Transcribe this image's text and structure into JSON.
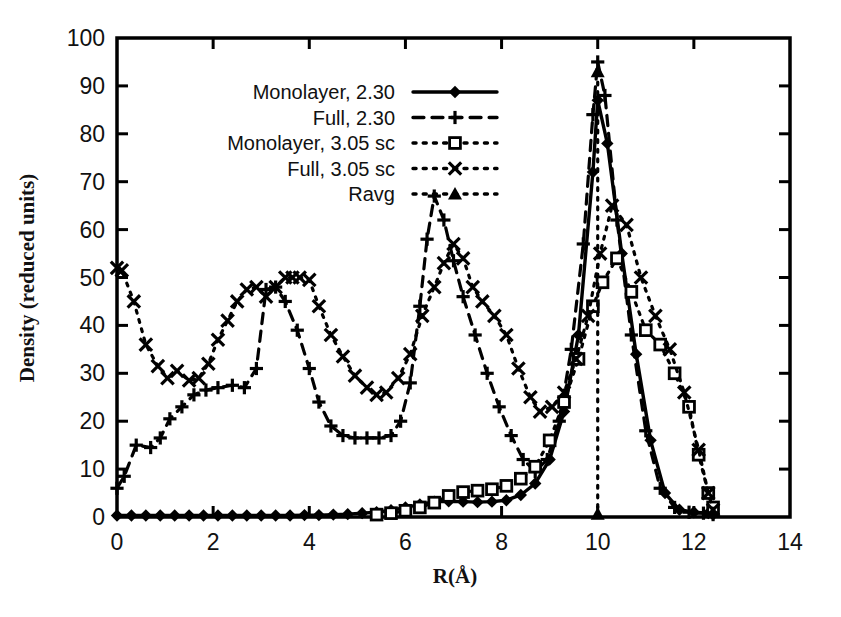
{
  "chart_data": {
    "type": "line",
    "title": "",
    "xlabel": "R(Å)",
    "ylabel": "Density (reduced units)",
    "xlim": [
      0,
      14
    ],
    "ylim": [
      0,
      100
    ],
    "xticks": [
      0,
      2,
      4,
      6,
      8,
      10,
      12,
      14
    ],
    "xtick_labels": [
      "0",
      "2",
      "4",
      "6",
      "8",
      "10",
      "12",
      "14"
    ],
    "yticks": [
      0,
      10,
      20,
      30,
      40,
      50,
      60,
      70,
      80,
      90,
      100
    ],
    "ytick_labels": [
      "0",
      "10",
      "20",
      "30",
      "40",
      "50",
      "60",
      "70",
      "80",
      "90",
      "100"
    ],
    "grid": false,
    "legend_position": "upper-left",
    "series": [
      {
        "name": "Monolayer, 2.30",
        "marker": "filled-diamond",
        "linestyle": "solid",
        "color": "#000000",
        "x": [
          0.0,
          0.3,
          0.6,
          0.9,
          1.2,
          1.5,
          1.8,
          2.1,
          2.4,
          2.7,
          3.0,
          3.3,
          3.6,
          3.9,
          4.2,
          4.5,
          4.8,
          5.1,
          5.4,
          5.7,
          6.0,
          6.3,
          6.6,
          6.9,
          7.2,
          7.5,
          7.8,
          8.1,
          8.4,
          8.7,
          9.0,
          9.3,
          9.6,
          9.9,
          10.0,
          10.2,
          10.5,
          10.8,
          11.1,
          11.4,
          11.7,
          12.0,
          12.3,
          12.4
        ],
        "y": [
          0.3,
          0.3,
          0.3,
          0.3,
          0.3,
          0.3,
          0.3,
          0.3,
          0.3,
          0.3,
          0.3,
          0.3,
          0.3,
          0.4,
          0.4,
          0.5,
          0.6,
          0.8,
          1.0,
          1.4,
          2.0,
          2.6,
          3.2,
          3.3,
          3.2,
          3.1,
          3.2,
          3.5,
          4.6,
          7.0,
          12.0,
          22.0,
          38.0,
          72.0,
          87.0,
          78.0,
          55.0,
          34.0,
          16.0,
          5.0,
          1.5,
          1.0,
          0.8,
          0.5
        ]
      },
      {
        "name": "Full, 2.30",
        "marker": "plus",
        "linestyle": "dashed",
        "color": "#000000",
        "x": [
          0.0,
          0.15,
          0.4,
          0.7,
          0.9,
          1.1,
          1.35,
          1.6,
          1.85,
          2.1,
          2.4,
          2.65,
          2.9,
          3.1,
          3.3,
          3.5,
          3.75,
          4.0,
          4.2,
          4.45,
          4.7,
          4.95,
          5.2,
          5.45,
          5.7,
          5.9,
          6.1,
          6.3,
          6.45,
          6.6,
          6.8,
          7.0,
          7.2,
          7.45,
          7.7,
          7.95,
          8.2,
          8.45,
          8.7,
          8.95,
          9.2,
          9.45,
          9.7,
          9.9,
          10.0,
          10.15,
          10.4,
          10.7,
          11.0,
          11.3,
          11.6,
          11.9,
          12.2,
          12.4
        ],
        "y": [
          6.0,
          8.5,
          15.0,
          14.5,
          16.5,
          20.5,
          23.0,
          25.5,
          26.5,
          27.0,
          27.5,
          27.0,
          31.0,
          47.5,
          48.0,
          45.0,
          39.0,
          31.0,
          24.0,
          19.0,
          17.0,
          16.5,
          16.5,
          16.5,
          17.0,
          20.0,
          28.0,
          44.0,
          58.0,
          67.0,
          62.0,
          53.5,
          46.0,
          38.0,
          30.0,
          23.0,
          17.0,
          12.0,
          9.5,
          12.0,
          20.0,
          35.0,
          57.0,
          84.0,
          95.0,
          88.0,
          62.0,
          38.0,
          18.0,
          6.0,
          2.0,
          1.0,
          0.8,
          0.5
        ]
      },
      {
        "name": "Monolayer, 3.05 sc",
        "marker": "open-square",
        "linestyle": "dotted",
        "color": "#000000",
        "x": [
          5.4,
          5.7,
          6.0,
          6.3,
          6.6,
          6.9,
          7.2,
          7.5,
          7.8,
          8.1,
          8.4,
          8.7,
          9.0,
          9.3,
          9.6,
          9.9,
          10.1,
          10.4,
          10.7,
          11.0,
          11.3,
          11.6,
          11.9,
          12.1,
          12.3,
          12.4
        ],
        "y": [
          0.5,
          0.8,
          1.3,
          2.0,
          3.0,
          4.4,
          5.2,
          5.5,
          5.8,
          6.5,
          8.0,
          10.5,
          16.0,
          24.0,
          33.0,
          44.0,
          49.0,
          54.0,
          47.0,
          39.0,
          36.0,
          30.0,
          23.0,
          13.0,
          5.0,
          2.0
        ]
      },
      {
        "name": "Full, 3.05 sc",
        "marker": "x",
        "linestyle": "dotted",
        "color": "#000000",
        "x": [
          0.0,
          0.1,
          0.35,
          0.6,
          0.85,
          1.05,
          1.25,
          1.5,
          1.7,
          1.9,
          2.1,
          2.3,
          2.5,
          2.7,
          2.9,
          3.1,
          3.3,
          3.5,
          3.65,
          3.8,
          4.0,
          4.2,
          4.45,
          4.7,
          4.95,
          5.2,
          5.4,
          5.6,
          5.85,
          6.1,
          6.35,
          6.6,
          6.8,
          7.0,
          7.2,
          7.4,
          7.6,
          7.85,
          8.1,
          8.35,
          8.6,
          8.8,
          9.05,
          9.3,
          9.55,
          9.8,
          10.05,
          10.3,
          10.6,
          10.9,
          11.2,
          11.5,
          11.8,
          12.1,
          12.3,
          12.4
        ],
        "y": [
          52.0,
          51.5,
          45.0,
          36.0,
          31.5,
          29.0,
          30.5,
          28.5,
          29.0,
          32.0,
          37.0,
          41.0,
          45.0,
          47.5,
          48.0,
          46.0,
          48.0,
          50.0,
          50.0,
          50.0,
          49.5,
          44.0,
          38.0,
          33.5,
          29.5,
          27.0,
          25.5,
          26.0,
          29.0,
          34.0,
          42.0,
          48.0,
          53.0,
          57.0,
          54.0,
          48.0,
          45.0,
          42.0,
          38.0,
          31.0,
          25.0,
          22.0,
          23.0,
          26.0,
          33.0,
          42.0,
          55.0,
          65.0,
          61.0,
          50.0,
          42.0,
          35.0,
          26.0,
          14.0,
          5.0,
          1.5
        ]
      },
      {
        "name": "Ravg",
        "marker": "filled-triangle",
        "linestyle": "dash-dot",
        "color": "#000000",
        "x": [
          10.0,
          10.0
        ],
        "y": [
          0.0,
          93.0
        ]
      }
    ]
  },
  "legend": {
    "items": [
      {
        "label": "Monolayer, 2.30",
        "marker": "filled-diamond",
        "linestyle": "solid"
      },
      {
        "label": "Full, 2.30",
        "marker": "plus",
        "linestyle": "dashed"
      },
      {
        "label": "Monolayer, 3.05 sc",
        "marker": "open-square",
        "linestyle": "dotted"
      },
      {
        "label": "Full, 3.05 sc",
        "marker": "x",
        "linestyle": "dotted"
      },
      {
        "label": "Ravg",
        "marker": "filled-triangle",
        "linestyle": "dash-dot"
      }
    ]
  }
}
